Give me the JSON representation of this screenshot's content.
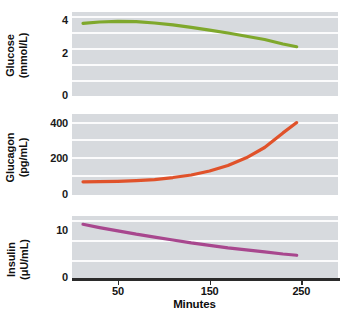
{
  "figure": {
    "background_color": "#ffffff",
    "plot_background_color": "#d7dade",
    "gridline_color": "#fbfbfc",
    "axis_color": "#2b2b2b"
  },
  "xaxis": {
    "title": "Minutes",
    "ticks": [
      50,
      150,
      250
    ],
    "tick_labels": [
      "50",
      "150",
      "250"
    ],
    "range": [
      0,
      290
    ]
  },
  "panels": [
    {
      "id": "glucose",
      "series_name": "Glucose",
      "unit": "(mmol/L)",
      "color": "#7FA82C",
      "yticks": [
        0,
        2,
        4
      ],
      "ytick_labels": [
        "0",
        "2",
        "4"
      ],
      "ylim": [
        0,
        5.2
      ]
    },
    {
      "id": "glucagon",
      "series_name": "Glucagon",
      "unit": "(pg/mL)",
      "color": "#E0522A",
      "yticks": [
        0,
        200,
        400
      ],
      "ytick_labels": [
        "0",
        "200",
        "400"
      ],
      "ylim": [
        0,
        460
      ]
    },
    {
      "id": "insulin",
      "series_name": "Insulin",
      "unit": "(μU/mL)",
      "color": "#A8478E",
      "yticks": [
        0,
        10
      ],
      "ytick_labels": [
        "0",
        "10"
      ],
      "ylim": [
        0,
        15
      ]
    }
  ],
  "chart_data": [
    {
      "type": "line",
      "title": "Glucose",
      "xlabel": "Minutes",
      "ylabel": "Glucose (mmol/L)",
      "xlim": [
        0,
        290
      ],
      "ylim": [
        0,
        5.2
      ],
      "grid": true,
      "legend": "none",
      "color": "#7FA82C",
      "x": [
        12,
        30,
        50,
        70,
        90,
        110,
        130,
        150,
        170,
        190,
        210,
        230,
        245
      ],
      "y": [
        4.5,
        4.58,
        4.62,
        4.6,
        4.52,
        4.4,
        4.25,
        4.08,
        3.9,
        3.7,
        3.5,
        3.22,
        3.05
      ]
    },
    {
      "type": "line",
      "title": "Glucagon",
      "xlabel": "Minutes",
      "ylabel": "Glucagon (pg/mL)",
      "xlim": [
        0,
        290
      ],
      "ylim": [
        0,
        460
      ],
      "grid": true,
      "legend": "none",
      "color": "#E0522A",
      "x": [
        12,
        30,
        50,
        70,
        90,
        110,
        130,
        150,
        170,
        190,
        210,
        230,
        245
      ],
      "y": [
        65,
        66,
        68,
        72,
        78,
        90,
        105,
        128,
        160,
        205,
        265,
        350,
        410
      ]
    },
    {
      "type": "line",
      "title": "Insulin",
      "xlabel": "Minutes",
      "ylabel": "Insulin (μU/mL)",
      "xlim": [
        0,
        290
      ],
      "ylim": [
        0,
        15
      ],
      "grid": true,
      "legend": "none",
      "color": "#A8478E",
      "x": [
        12,
        30,
        50,
        70,
        90,
        110,
        130,
        150,
        170,
        190,
        210,
        230,
        245
      ],
      "y": [
        13.0,
        12.2,
        11.4,
        10.6,
        9.9,
        9.2,
        8.5,
        7.9,
        7.3,
        6.8,
        6.3,
        5.8,
        5.5
      ]
    }
  ]
}
